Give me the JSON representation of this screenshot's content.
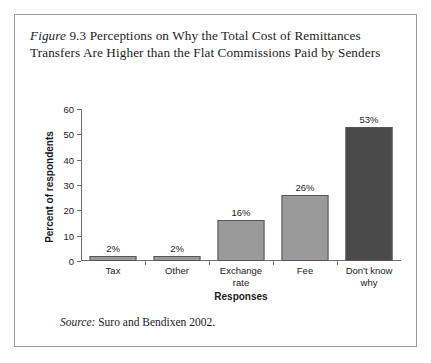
{
  "figure": {
    "label_word": "Figure",
    "number": "9.3",
    "title_text": "Perceptions on Why the Total Cost of Remittances Transfers Are Higher than the Flat Commissions Paid by Senders",
    "source_label": "Source:",
    "source_text": "Suro and Bendixen 2002."
  },
  "colors": {
    "bar_light": "#9a9a9a",
    "bar_dark": "#4a4a4a",
    "bar_border": "#555555",
    "axis": "#6f6f6f",
    "frame": "#9d9d9d",
    "text": "#1a1a1a"
  },
  "chart_data": {
    "type": "bar",
    "title": "Perceptions on Why the Total Cost of Remittances Transfers Are Higher than the Flat Commissions Paid by Senders",
    "xlabel": "Responses",
    "ylabel": "Percent of respondents",
    "categories": [
      "Tax",
      "Other",
      "Exchange rate",
      "Fee",
      "Don't know why"
    ],
    "category_lines": [
      [
        "Tax"
      ],
      [
        "Other"
      ],
      [
        "Exchange",
        "rate"
      ],
      [
        "Fee"
      ],
      [
        "Don't know",
        "why"
      ]
    ],
    "values": [
      2,
      2,
      16,
      26,
      53
    ],
    "data_labels": [
      "2%",
      "2%",
      "16%",
      "26%",
      "53%"
    ],
    "bar_colors": [
      "#9a9a9a",
      "#9a9a9a",
      "#9a9a9a",
      "#9a9a9a",
      "#4a4a4a"
    ],
    "ylim": [
      0,
      60
    ],
    "yticks": [
      0,
      10,
      20,
      30,
      40,
      50,
      60
    ],
    "ytick_labels": [
      "0",
      "10",
      "20",
      "30",
      "40",
      "50",
      "60"
    ],
    "grid": false,
    "legend": "none"
  }
}
